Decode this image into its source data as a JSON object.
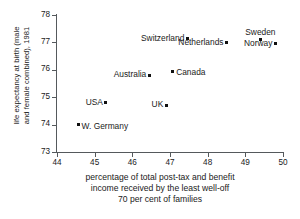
{
  "chart_data": {
    "type": "scatter",
    "title": "",
    "xlabel": "percentage of total post-tax and benefit\nincome received by the least well-off\n70 per cent of families",
    "ylabel": "life expectancy at birth (male\nand female combined), 1981",
    "xlim": [
      44,
      50
    ],
    "ylim": [
      73,
      78
    ],
    "xticks": [
      44,
      45,
      46,
      47,
      48,
      49,
      50
    ],
    "yticks": [
      78,
      77,
      76,
      75,
      74,
      73
    ],
    "xtick_labels": [
      "44",
      "45",
      "46",
      "47",
      "48",
      "49",
      "50"
    ],
    "ytick_labels": [
      "78",
      "77",
      "76",
      "75",
      "74",
      "73"
    ],
    "grid": false,
    "legend": null,
    "marker_color": "#111111",
    "axis_color": "#55595c",
    "points": [
      {
        "label": "Switzerland",
        "x": 47.46,
        "y": 77.13,
        "label_pos": "left"
      },
      {
        "label": "Netherlands",
        "x": 48.5,
        "y": 76.99,
        "label_pos": "left"
      },
      {
        "label": "Sweden",
        "x": 49.4,
        "y": 77.09,
        "label_pos": "above"
      },
      {
        "label": "Norway",
        "x": 49.8,
        "y": 76.95,
        "label_pos": "left"
      },
      {
        "label": "Australia",
        "x": 46.45,
        "y": 75.8,
        "label_pos": "left"
      },
      {
        "label": "Canada",
        "x": 47.07,
        "y": 75.95,
        "label_pos": "right"
      },
      {
        "label": "USA",
        "x": 45.3,
        "y": 74.8,
        "label_pos": "left"
      },
      {
        "label": "UK",
        "x": 46.9,
        "y": 74.7,
        "label_pos": "left"
      },
      {
        "label": "W. Germany",
        "x": 44.56,
        "y": 74.0,
        "label_pos": "right"
      }
    ]
  },
  "axes": {
    "y_axis_label": "life expectancy at birth (male\nand female combined), 1981",
    "x_axis_caption": "percentage of total post-tax and benefit\nincome received by the least well-off\n70 per cent of families"
  }
}
